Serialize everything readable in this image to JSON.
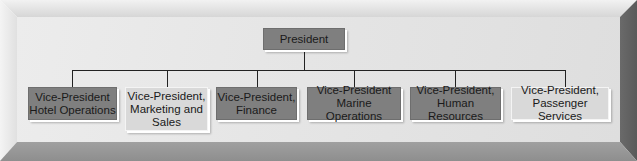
{
  "diagram": {
    "type": "org-chart",
    "root": {
      "label": "President",
      "style": "dark"
    },
    "children": [
      {
        "label": "Vice-President\nHotel Operations",
        "style": "dark"
      },
      {
        "label": "Vice-President,\nMarketing and\nSales",
        "style": "light"
      },
      {
        "label": "Vice-President,\nFinance",
        "style": "dark"
      },
      {
        "label": "Vice-President\nMarine Operations",
        "style": "dark"
      },
      {
        "label": "Vice-President,\nHuman Resources",
        "style": "dark"
      },
      {
        "label": "Vice-President,\nPassenger Services",
        "style": "light"
      }
    ]
  },
  "colors": {
    "dark_box": "#7f7f7f",
    "light_box": "#d9d9d9",
    "panel": "#e4e4e4",
    "connector": "#222222"
  }
}
